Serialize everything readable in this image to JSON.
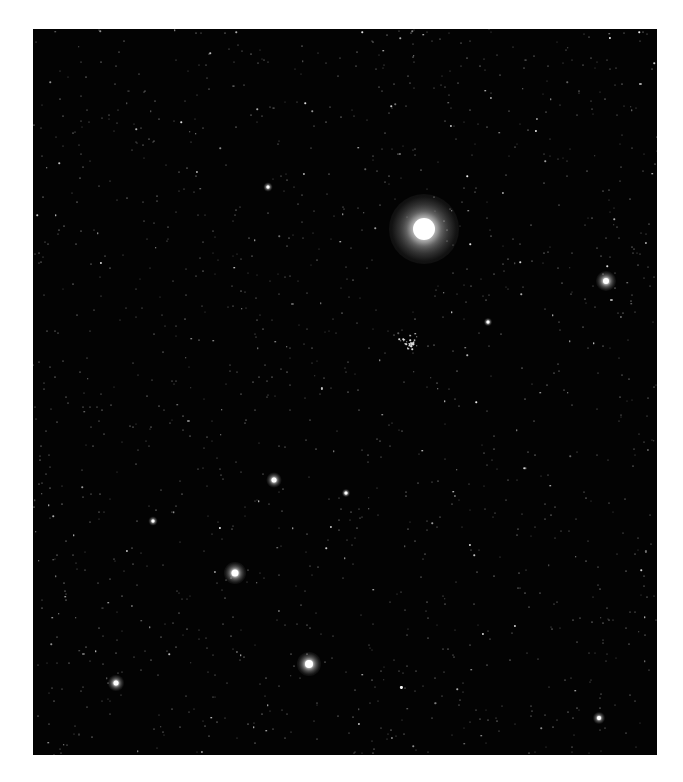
{
  "image": {
    "subject": "star field",
    "background_color": "#030303",
    "frame": {
      "left": 33,
      "top": 29,
      "width": 624,
      "height": 726
    }
  },
  "bright_stars": [
    {
      "x": 424,
      "y": 229,
      "core": 22,
      "halo": 70,
      "label": "brightest-star"
    },
    {
      "x": 606,
      "y": 281,
      "core": 6,
      "halo": 20,
      "label": "star-right"
    },
    {
      "x": 235,
      "y": 573,
      "core": 7,
      "halo": 22,
      "label": "star-lower-left"
    },
    {
      "x": 309,
      "y": 664,
      "core": 8,
      "halo": 24,
      "label": "star-bottom"
    },
    {
      "x": 116,
      "y": 683,
      "core": 5,
      "halo": 16,
      "label": "star-bottom-left"
    },
    {
      "x": 274,
      "y": 480,
      "core": 5,
      "halo": 15,
      "label": "star-mid"
    },
    {
      "x": 599,
      "y": 718,
      "core": 4,
      "halo": 12,
      "label": "star-bottom-right"
    },
    {
      "x": 153,
      "y": 521,
      "core": 3,
      "halo": 9,
      "label": "star-small-1"
    },
    {
      "x": 268,
      "y": 187,
      "core": 3,
      "halo": 9,
      "label": "star-small-2"
    },
    {
      "x": 346,
      "y": 493,
      "core": 3,
      "halo": 8,
      "label": "star-small-3"
    },
    {
      "x": 488,
      "y": 322,
      "core": 3,
      "halo": 8,
      "label": "star-small-4"
    }
  ],
  "cluster": {
    "x": 410,
    "y": 344,
    "radius": 12,
    "label": "star-cluster"
  },
  "faint_star_count": 1400
}
